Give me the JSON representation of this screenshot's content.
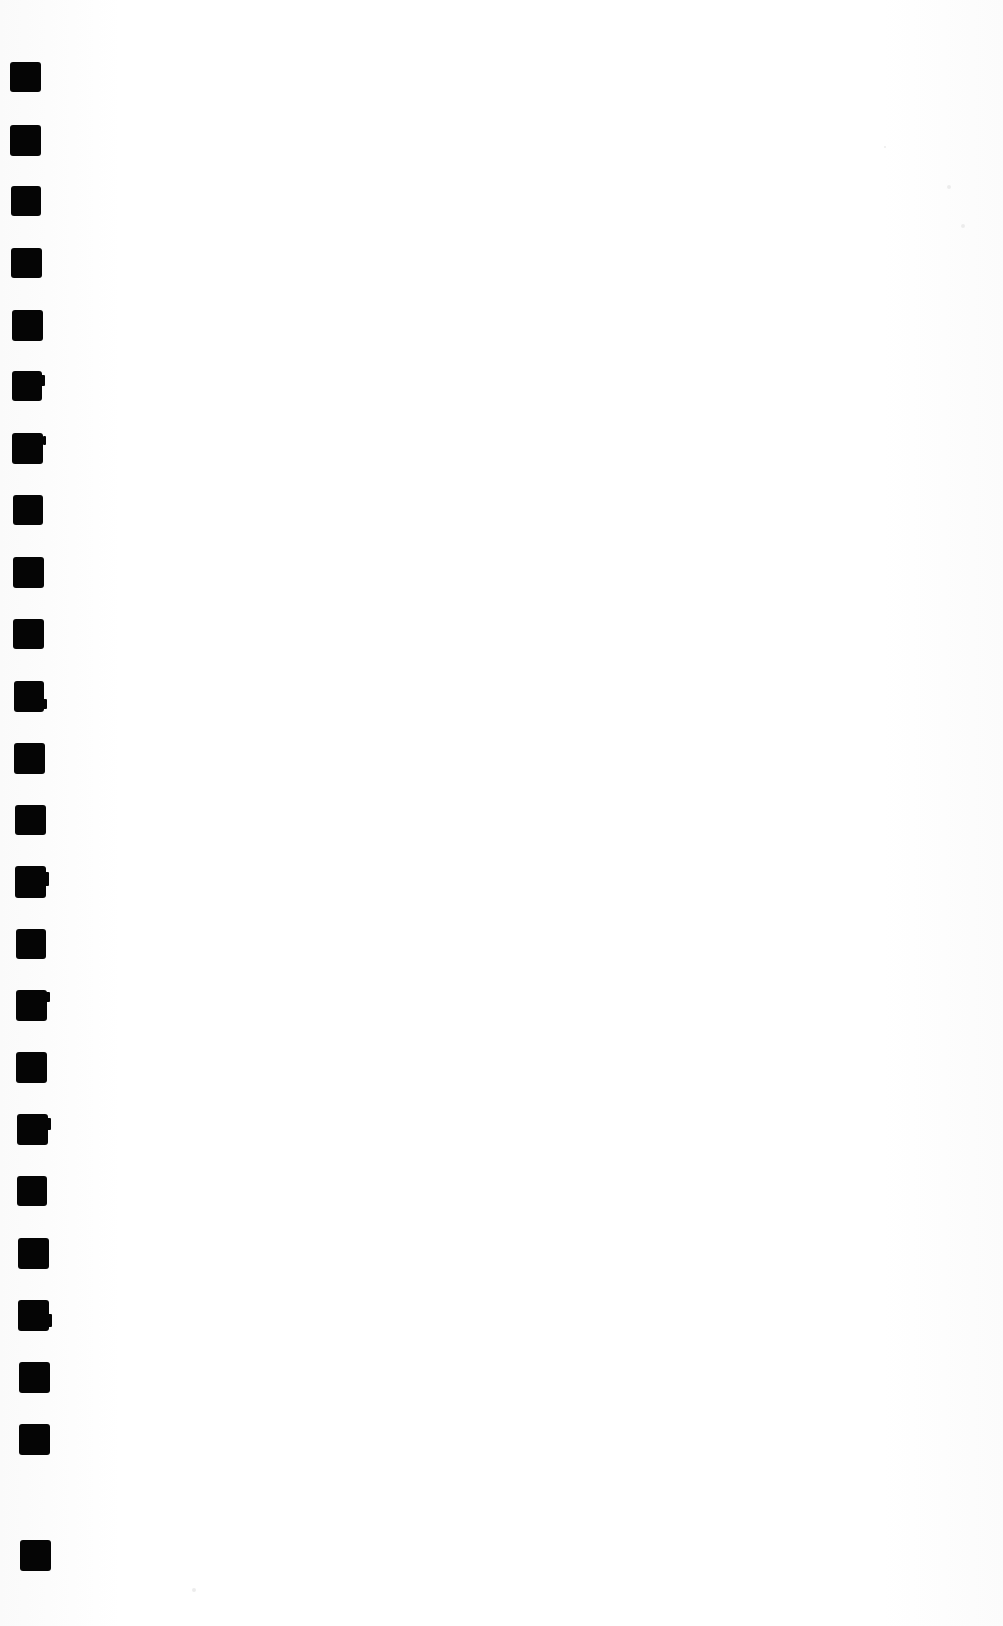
{
  "page": {
    "width": 1003,
    "height": 1626,
    "background_color": "#fdfdfd",
    "ink_color": "#050505",
    "content_text": "",
    "content_note": "blank page body"
  },
  "margin_marks": {
    "name": "binding-punch-marks",
    "count": 24,
    "shape": "square",
    "color": "#050505",
    "items": [
      {
        "x": 10,
        "y": 62,
        "w": 31,
        "h": 30,
        "nub": null
      },
      {
        "x": 10,
        "y": 125,
        "w": 31,
        "h": 31,
        "nub": null
      },
      {
        "x": 11,
        "y": 186,
        "w": 30,
        "h": 30,
        "nub": null
      },
      {
        "x": 11,
        "y": 248,
        "w": 31,
        "h": 30,
        "nub": null
      },
      {
        "x": 12,
        "y": 310,
        "w": 31,
        "h": 31,
        "nub": null
      },
      {
        "x": 12,
        "y": 371,
        "w": 30,
        "h": 30,
        "nub": {
          "y": 4,
          "w": 4,
          "h": 11
        }
      },
      {
        "x": 12,
        "y": 433,
        "w": 31,
        "h": 31,
        "nub": {
          "y": 3,
          "w": 3,
          "h": 9
        }
      },
      {
        "x": 13,
        "y": 495,
        "w": 30,
        "h": 30,
        "nub": null
      },
      {
        "x": 13,
        "y": 557,
        "w": 31,
        "h": 31,
        "nub": null
      },
      {
        "x": 13,
        "y": 619,
        "w": 31,
        "h": 30,
        "nub": null
      },
      {
        "x": 14,
        "y": 681,
        "w": 30,
        "h": 31,
        "nub": {
          "y": 18,
          "w": 4,
          "h": 10
        }
      },
      {
        "x": 14,
        "y": 743,
        "w": 31,
        "h": 31,
        "nub": null
      },
      {
        "x": 15,
        "y": 805,
        "w": 31,
        "h": 30,
        "nub": null
      },
      {
        "x": 15,
        "y": 866,
        "w": 31,
        "h": 32,
        "nub": {
          "y": 6,
          "w": 5,
          "h": 14
        }
      },
      {
        "x": 16,
        "y": 929,
        "w": 30,
        "h": 30,
        "nub": null
      },
      {
        "x": 16,
        "y": 990,
        "w": 31,
        "h": 31,
        "nub": {
          "y": 2,
          "w": 4,
          "h": 10
        }
      },
      {
        "x": 16,
        "y": 1052,
        "w": 31,
        "h": 31,
        "nub": null
      },
      {
        "x": 17,
        "y": 1114,
        "w": 31,
        "h": 31,
        "nub": {
          "y": 4,
          "w": 4,
          "h": 12
        }
      },
      {
        "x": 17,
        "y": 1176,
        "w": 30,
        "h": 30,
        "nub": null
      },
      {
        "x": 18,
        "y": 1238,
        "w": 31,
        "h": 31,
        "nub": null
      },
      {
        "x": 18,
        "y": 1300,
        "w": 31,
        "h": 31,
        "nub": {
          "y": 14,
          "w": 4,
          "h": 13
        }
      },
      {
        "x": 19,
        "y": 1362,
        "w": 31,
        "h": 31,
        "nub": null
      },
      {
        "x": 19,
        "y": 1424,
        "w": 31,
        "h": 31,
        "nub": null
      },
      {
        "x": 20,
        "y": 1540,
        "w": 31,
        "h": 31,
        "nub": null
      }
    ]
  },
  "artifacts": {
    "specks": [
      {
        "x": 947,
        "y": 185,
        "r": 2
      },
      {
        "x": 961,
        "y": 224,
        "r": 2
      },
      {
        "x": 192,
        "y": 1588,
        "r": 2
      },
      {
        "x": 884,
        "y": 146,
        "r": 1
      }
    ]
  }
}
